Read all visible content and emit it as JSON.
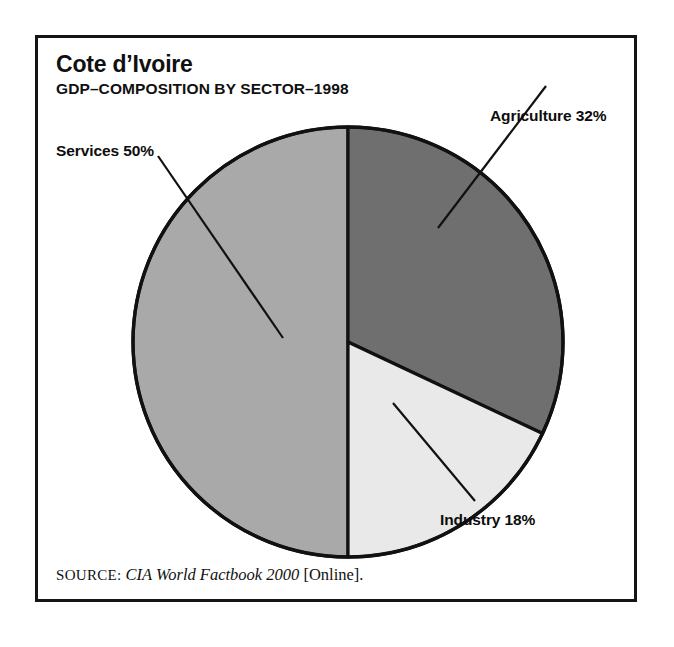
{
  "figure": {
    "title": "Cote d’Ivoire",
    "subtitle": "GDP–COMPOSITION BY SECTOR–1998",
    "source_label": "SOURCE:",
    "source_work": "CIA World Factbook 2000",
    "source_suffix": "[Online]."
  },
  "labels": {
    "agriculture": "Agriculture 32%",
    "services": "Services 50%",
    "industry": "Industry 18%"
  },
  "chart_data": {
    "type": "pie",
    "title": "Cote d’Ivoire",
    "subtitle": "GDP–COMPOSITION BY SECTOR–1998",
    "categories": [
      "Agriculture",
      "Industry",
      "Services"
    ],
    "values": [
      32,
      18,
      50
    ],
    "units": "percent",
    "total": 100,
    "start_angle_deg": 0,
    "direction": "clockwise",
    "legend": "none",
    "data_labels": [
      "Agriculture 32%",
      "Industry 18%",
      "Services 50%"
    ],
    "colors": {
      "agriculture": "#6f6f6f",
      "industry": "#e9e9e9",
      "services": "#a9a9a9",
      "outline": "#111111",
      "background": "#ffffff"
    },
    "geometry": {
      "center_x": 345,
      "center_y": 339,
      "radius": 215
    },
    "slices": [
      {
        "name": "Agriculture",
        "value": 32,
        "color": "#6f6f6f",
        "start_deg": 0.0,
        "end_deg": 115.2
      },
      {
        "name": "Industry",
        "value": 18,
        "color": "#e9e9e9",
        "start_deg": 115.2,
        "end_deg": 180.0
      },
      {
        "name": "Services",
        "value": 50,
        "color": "#a9a9a9",
        "start_deg": 180.0,
        "end_deg": 360.0
      }
    ]
  }
}
